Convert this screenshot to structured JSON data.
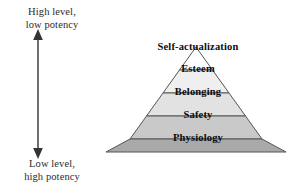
{
  "figure": {
    "type": "pyramid-diagram",
    "background_color": "#ffffff",
    "outline_color": "#555555"
  },
  "axis": {
    "top_label": "High level,\nlow potency",
    "bottom_label": "Low level,\nhigh potency",
    "arrow_style": "double-headed-vertical",
    "arrow_color": "#333333"
  },
  "pyramid": {
    "tiers": [
      {
        "label": "Self-actualization",
        "fill": "#ffffff",
        "level": 5
      },
      {
        "label": "Esteem",
        "fill": "#efefef",
        "level": 4
      },
      {
        "label": "Belonging",
        "fill": "#e2e2e2",
        "level": 3
      },
      {
        "label": "Safety",
        "fill": "#c9c9c9",
        "level": 2
      },
      {
        "label": "Physiology",
        "fill": "#a9a9a9",
        "level": 1
      }
    ]
  }
}
